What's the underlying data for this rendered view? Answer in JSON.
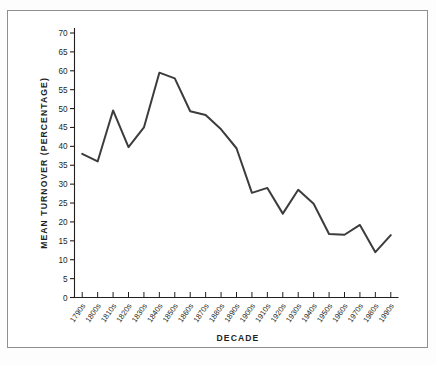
{
  "figure": {
    "background_color": "#ffffff",
    "border_color": "#8d8f91",
    "line_color": "#3c3c3c",
    "axis_color": "#231f20",
    "text_color": "#231f20"
  },
  "chart_data": {
    "type": "line",
    "title": "",
    "subtitle": "",
    "xlabel": "DECADE",
    "ylabel": "MEAN TURNOVER (PERCENTAGE)",
    "categories": [
      "1790s",
      "1800s",
      "1810s",
      "1820s",
      "1830s",
      "1840s",
      "1850s",
      "1860s",
      "1870s",
      "1880s",
      "1890s",
      "1900s",
      "1910s",
      "1920s",
      "1930s",
      "1940s",
      "1950s",
      "1960s",
      "1970s",
      "1980s",
      "1990s"
    ],
    "values": [
      38.0,
      36.0,
      49.5,
      39.8,
      45.0,
      59.5,
      58.0,
      49.3,
      48.3,
      44.5,
      39.5,
      27.7,
      29.0,
      22.2,
      28.5,
      24.8,
      16.8,
      16.6,
      19.2,
      12.0,
      16.5
    ],
    "ylim": [
      0,
      70
    ],
    "ytick_values": [
      0,
      5,
      10,
      15,
      20,
      25,
      30,
      35,
      40,
      45,
      50,
      55,
      60,
      65,
      70
    ],
    "ytick_labels": [
      "0",
      "5",
      "10",
      "15",
      "20",
      "25",
      "30",
      "35",
      "40",
      "45",
      "50",
      "55",
      "60",
      "65",
      "70"
    ],
    "grid": false,
    "legend": null,
    "legend_position": "none",
    "series_name": "Mean turnover",
    "xtick_rotation_degrees": -55,
    "marker": "none",
    "line_width_px": 2
  }
}
